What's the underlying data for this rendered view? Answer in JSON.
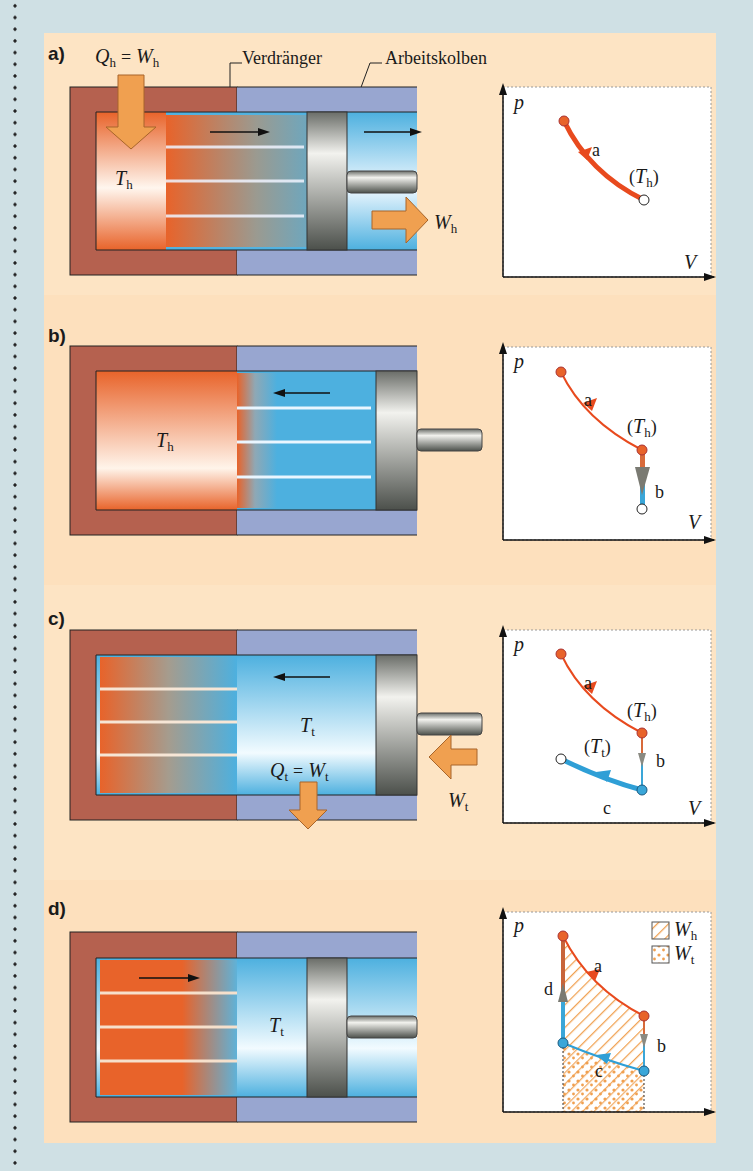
{
  "figure": {
    "panels": [
      {
        "id": "a",
        "label": "a)",
        "top_labels": {
          "heat": "Q",
          "heat_sub": "h",
          "equals": "=",
          "work": "W",
          "work_sub": "h",
          "displacer": "Verdränger",
          "piston": "Arbeitskolben"
        },
        "temp": {
          "sym": "T",
          "sub": "h"
        },
        "work_out": {
          "sym": "W",
          "sub": "h"
        },
        "pv": {
          "p_axis": "p",
          "v_axis": "V",
          "curve_label": "a",
          "temp_label_open": "(",
          "temp_label_sym": "T",
          "temp_label_sub": "h",
          "temp_label_close": ")"
        }
      },
      {
        "id": "b",
        "label": "b)",
        "temp": {
          "sym": "T",
          "sub": "h"
        },
        "pv": {
          "p_axis": "p",
          "v_axis": "V",
          "curve_a": "a",
          "curve_b": "b",
          "temp_label_sym": "T",
          "temp_label_sub": "h"
        }
      },
      {
        "id": "c",
        "label": "c)",
        "temp": {
          "sym": "T",
          "sub": "t"
        },
        "heat_out": {
          "heat": "Q",
          "heat_sub": "t",
          "equals": "=",
          "work": "W",
          "work_sub": "t"
        },
        "work_in": {
          "sym": "W",
          "sub": "t"
        },
        "pv": {
          "p_axis": "p",
          "v_axis": "V",
          "curve_a": "a",
          "curve_b": "b",
          "curve_c": "c",
          "th_sym": "T",
          "th_sub": "h",
          "tt_sym": "T",
          "tt_sub": "t"
        }
      },
      {
        "id": "d",
        "label": "d)",
        "temp": {
          "sym": "T",
          "sub": "t"
        },
        "pv": {
          "p_axis": "p",
          "v_axis": "V",
          "curve_a": "a",
          "curve_b": "b",
          "curve_c": "c",
          "curve_d": "d",
          "legend": [
            {
              "sym": "W",
              "sub": "h",
              "pattern": "hatched"
            },
            {
              "sym": "W",
              "sub": "t",
              "pattern": "dotted"
            }
          ]
        }
      }
    ],
    "colors": {
      "hot": "#e8632a",
      "cold": "#3aa6d8",
      "arrow_orange": "#f0a050",
      "wall_hot": "#b5614f",
      "wall_cold": "#98a6d0",
      "background": "#cfe0e4",
      "panel": "#fde4c4"
    }
  }
}
